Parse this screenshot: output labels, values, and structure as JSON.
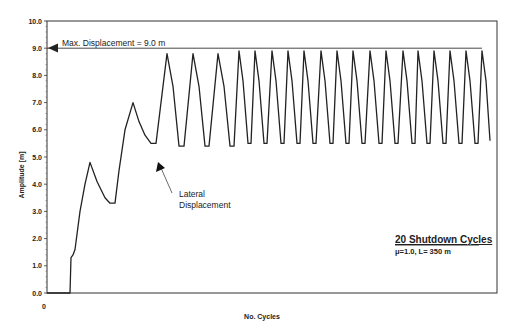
{
  "chart_data": {
    "type": "line",
    "title": "",
    "xlabel": "No. Cycles",
    "ylabel": "Amplitude [m]",
    "ylim": [
      0.0,
      10.0
    ],
    "yticks": [
      "0.0",
      "1.0",
      "2.0",
      "3.0",
      "4.0",
      "5.0",
      "6.0",
      "7.0",
      "8.0",
      "9.0",
      "10.0"
    ],
    "xticks": [
      "0"
    ],
    "grid": false,
    "legend": {
      "title": "20 Shutdown Cycles",
      "subtitle": "μ=1.0, L= 350 m",
      "position": "lower right"
    },
    "annotations": [
      {
        "text": "Max. Displacement = 9.0 m",
        "type": "horizontal-line",
        "y": 9.0
      },
      {
        "text_line1": "Lateral",
        "text_line2": "Displacement",
        "type": "arrow",
        "points_to": "trough at ~5.5 m before first shutdown cycle"
      }
    ],
    "series": [
      {
        "name": "Amplitude",
        "note": "x in relative plot units (0-450), y in metres",
        "points": [
          [
            0,
            0.0
          ],
          [
            15,
            0.0
          ],
          [
            20,
            0.0
          ],
          [
            23,
            0.0
          ],
          [
            24,
            1.3
          ],
          [
            26,
            1.4
          ],
          [
            28,
            1.6
          ],
          [
            33,
            3.0
          ],
          [
            38,
            4.0
          ],
          [
            43,
            4.8
          ],
          [
            50,
            4.1
          ],
          [
            58,
            3.5
          ],
          [
            63,
            3.3
          ],
          [
            68,
            3.3
          ],
          [
            72,
            4.5
          ],
          [
            78,
            6.0
          ],
          [
            86,
            7.0
          ],
          [
            92,
            6.3
          ],
          [
            98,
            5.8
          ],
          [
            104,
            5.5
          ],
          [
            109,
            5.5
          ],
          [
            120,
            8.8
          ],
          [
            126,
            7.6
          ],
          [
            132,
            5.4
          ],
          [
            137,
            5.4
          ],
          [
            146,
            8.8
          ],
          [
            152,
            7.6
          ],
          [
            158,
            5.4
          ],
          [
            162,
            5.4
          ],
          [
            171,
            8.8
          ],
          [
            177,
            7.6
          ],
          [
            183,
            5.4
          ],
          [
            187,
            5.4
          ],
          [
            192,
            8.9
          ],
          [
            196,
            7.8
          ],
          [
            201,
            5.5
          ],
          [
            204,
            5.5
          ],
          [
            208,
            8.9
          ],
          [
            212,
            7.8
          ],
          [
            217,
            5.5
          ],
          [
            220,
            5.5
          ],
          [
            225,
            8.9
          ],
          [
            229,
            7.8
          ],
          [
            234,
            5.5
          ],
          [
            237,
            5.5
          ],
          [
            241,
            8.9
          ],
          [
            245,
            7.8
          ],
          [
            250,
            5.5
          ],
          [
            253,
            5.5
          ],
          [
            257,
            8.9
          ],
          [
            261,
            7.8
          ],
          [
            266,
            5.5
          ],
          [
            269,
            5.5
          ],
          [
            274,
            8.9
          ],
          [
            278,
            7.8
          ],
          [
            283,
            5.5
          ],
          [
            286,
            5.5
          ],
          [
            290,
            8.9
          ],
          [
            294,
            7.8
          ],
          [
            299,
            5.5
          ],
          [
            302,
            5.5
          ],
          [
            306,
            8.9
          ],
          [
            310,
            7.8
          ],
          [
            315,
            5.5
          ],
          [
            318,
            5.5
          ],
          [
            323,
            8.9
          ],
          [
            327,
            7.8
          ],
          [
            332,
            5.5
          ],
          [
            335,
            5.5
          ],
          [
            339,
            8.9
          ],
          [
            343,
            7.8
          ],
          [
            348,
            5.5
          ],
          [
            351,
            5.5
          ],
          [
            356,
            8.9
          ],
          [
            360,
            7.8
          ],
          [
            365,
            5.5
          ],
          [
            368,
            5.5
          ],
          [
            371,
            8.9
          ],
          [
            375,
            7.8
          ],
          [
            380,
            5.5
          ],
          [
            383,
            5.5
          ],
          [
            387,
            8.9
          ],
          [
            391,
            7.8
          ],
          [
            396,
            5.5
          ],
          [
            399,
            5.5
          ],
          [
            403,
            8.9
          ],
          [
            407,
            7.8
          ],
          [
            412,
            5.5
          ],
          [
            415,
            5.5
          ],
          [
            419,
            8.9
          ],
          [
            423,
            7.8
          ],
          [
            428,
            5.5
          ],
          [
            431,
            5.5
          ],
          [
            435,
            8.9
          ],
          [
            439,
            7.8
          ],
          [
            443,
            5.6
          ]
        ]
      }
    ],
    "max_line": {
      "y": 9.0,
      "x_end": 435
    }
  },
  "plot": {
    "left": 47,
    "right": 497,
    "top": 21,
    "bottom": 293
  }
}
